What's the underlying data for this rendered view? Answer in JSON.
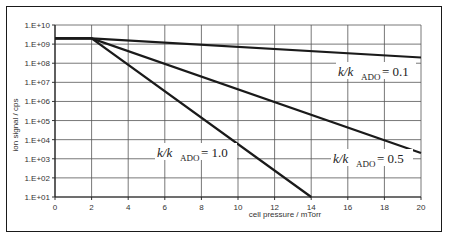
{
  "chart_data": {
    "type": "line",
    "title": "",
    "xlabel": "cell pressure / mTorr",
    "ylabel": "ion signal / cps",
    "xlim": [
      0,
      20
    ],
    "ylim": [
      10,
      10000000000
    ],
    "yscale": "log",
    "grid": true,
    "legend": "none (inline annotations)",
    "x_ticks": [
      "0",
      "2",
      "4",
      "6",
      "8",
      "10",
      "12",
      "14",
      "16",
      "18",
      "20"
    ],
    "y_ticks": [
      "1.E+01",
      "1.E+02",
      "1.E+03",
      "1.E+04",
      "1.E+05",
      "1.E+06",
      "1.E+07",
      "1.E+08",
      "1.E+09",
      "1.E+10"
    ],
    "series": [
      {
        "name": "k/kADO = 0.1",
        "x": [
          0,
          2,
          20
        ],
        "y": [
          2000000000,
          2000000000,
          200000000
        ]
      },
      {
        "name": "k/kADO = 0.5",
        "x": [
          0,
          2,
          20
        ],
        "y": [
          2000000000,
          2000000000,
          2000
        ]
      },
      {
        "name": "k/kADO = 1.0",
        "x": [
          0,
          2,
          14
        ],
        "y": [
          2000000000,
          2000000000,
          10
        ]
      }
    ],
    "annotations": [
      {
        "text": "k/kADO= 0.1",
        "main": "k/k",
        "sub": "ADO",
        "value": "= 0.1"
      },
      {
        "text": "k/kADO= 0.5",
        "main": "k/k",
        "sub": "ADO",
        "value": "= 0.5"
      },
      {
        "text": "k/kADO= 1.0",
        "main": "k/k",
        "sub": "ADO",
        "value": "= 1.0"
      }
    ]
  }
}
